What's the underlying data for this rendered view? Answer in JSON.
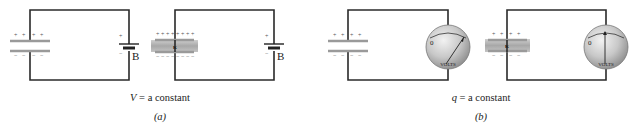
{
  "figure": {
    "panel_a": {
      "label": "(a)",
      "caption_var": "V",
      "caption_rest": " = a constant",
      "battery_label": "B",
      "battery_plus": "+",
      "battery_minus": "−",
      "dielectric_symbol": "κ"
    },
    "panel_b": {
      "label": "(b)",
      "caption_var": "q",
      "caption_rest": " = a constant",
      "meter_label": "VOLTS",
      "meter_zero": "0",
      "dielectric_symbol": "κ",
      "meter_reading_without_dielectric": "high",
      "meter_reading_with_dielectric": "lower"
    },
    "charge_signs": {
      "plus": "+",
      "minus": "−"
    }
  }
}
